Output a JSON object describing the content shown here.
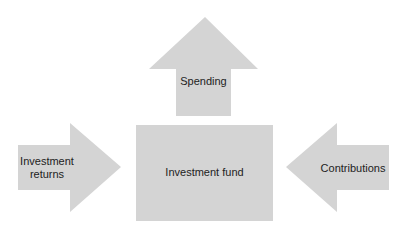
{
  "diagram": {
    "fill_color": "#d4d4d4",
    "nodes": {
      "fund": {
        "label": "Investment fund"
      },
      "spending": {
        "label": "Spending",
        "direction": "up"
      },
      "returns": {
        "label_line1": "Investment",
        "label_line2": "returns",
        "direction": "right"
      },
      "contributions": {
        "label": "Contributions",
        "direction": "left"
      }
    }
  }
}
